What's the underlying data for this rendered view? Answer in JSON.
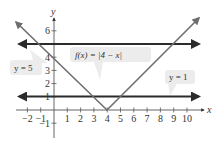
{
  "chart_data": {
    "type": "line",
    "title": "",
    "xlabel": "x",
    "ylabel": "y",
    "xlim": [
      -2.8,
      11
    ],
    "ylim": [
      -2.3,
      7.1
    ],
    "grid": false,
    "x_ticks": [
      -2,
      -1,
      1,
      2,
      3,
      4,
      5,
      6,
      7,
      8,
      9,
      10
    ],
    "y_ticks": [
      -1,
      1,
      2,
      3,
      4,
      6
    ],
    "x_tick_labels": [
      "−2",
      "−1",
      "1",
      "2",
      "3",
      "4",
      "5",
      "6",
      "7",
      "8",
      "9",
      "10"
    ],
    "y_tick_labels": [
      "−1",
      "1",
      "2",
      "3",
      "4",
      "6"
    ],
    "series": [
      {
        "name": "f(x) = |4 − x|",
        "kind": "absolute-value",
        "color": "#6e6e6e",
        "x": [
          -2.9,
          4,
          11.9
        ],
        "y": [
          6.9,
          0,
          7.9
        ]
      },
      {
        "name": "y = 5",
        "kind": "horizontal-line",
        "color": "#2b2b2b",
        "x": [
          -2.8,
          10.8
        ],
        "y": [
          5,
          5
        ]
      },
      {
        "name": "y = 1",
        "kind": "horizontal-line",
        "color": "#2b2b2b",
        "x": [
          -2.8,
          10.8
        ],
        "y": [
          1,
          1
        ]
      }
    ],
    "annotations": [
      {
        "text": "f(x) = |4 − x|",
        "points_to": [
          3.2,
          0.8
        ]
      },
      {
        "text": "y = 5",
        "points_to": [
          0.6,
          5
        ]
      },
      {
        "text": "y = 1",
        "points_to": [
          8.5,
          1
        ]
      }
    ],
    "intersections": [
      [
        -1,
        5
      ],
      [
        9,
        5
      ],
      [
        3,
        1
      ],
      [
        5,
        1
      ]
    ]
  },
  "labels": {
    "x_axis": "x",
    "y_axis": "y",
    "callout_f": "f(x) = |4 − x|",
    "callout_y5": "y = 5",
    "callout_y1": "y = 1"
  }
}
